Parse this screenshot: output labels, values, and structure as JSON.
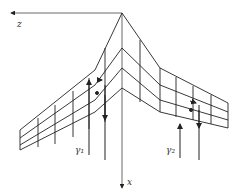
{
  "diagram": {
    "axes": {
      "z_label": "z",
      "x_label": "x"
    },
    "vortex_labels": {
      "left": "γ₁",
      "right": "γ₂"
    },
    "colors": {
      "line": "#222222",
      "background": "#ffffff"
    }
  }
}
